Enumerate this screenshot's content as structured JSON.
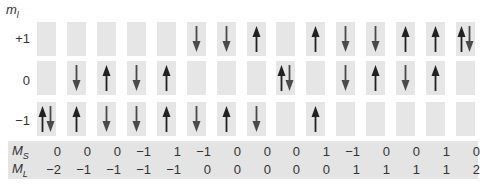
{
  "diagram": {
    "axis_title": "m",
    "axis_title_sub": "l",
    "row_labels": [
      "+1",
      "0",
      "−1"
    ],
    "ms_label": "M",
    "ms_label_sub": "S",
    "ml_label": "M",
    "ml_label_sub": "L",
    "colors": {
      "box": "#e6e6e6",
      "band": "#e4e4e4",
      "arrow_up": "#222222",
      "arrow_down": "#4a4a4a",
      "text": "#333333"
    },
    "columns": [
      {
        "plus1": "",
        "zero": "",
        "minus1": "updown",
        "MS": "0",
        "ML": "−2"
      },
      {
        "plus1": "",
        "zero": "down",
        "minus1": "up",
        "MS": "0",
        "ML": "−1"
      },
      {
        "plus1": "",
        "zero": "up",
        "minus1": "down",
        "MS": "0",
        "ML": "−1"
      },
      {
        "plus1": "",
        "zero": "down",
        "minus1": "down",
        "MS": "−1",
        "ML": "−1"
      },
      {
        "plus1": "",
        "zero": "up",
        "minus1": "up",
        "MS": "1",
        "ML": "−1"
      },
      {
        "plus1": "down",
        "zero": "",
        "minus1": "down",
        "MS": "−1",
        "ML": "0"
      },
      {
        "plus1": "down",
        "zero": "",
        "minus1": "up",
        "MS": "0",
        "ML": "0"
      },
      {
        "plus1": "up",
        "zero": "",
        "minus1": "down",
        "MS": "0",
        "ML": "0"
      },
      {
        "plus1": "",
        "zero": "updown",
        "minus1": "",
        "MS": "0",
        "ML": "0"
      },
      {
        "plus1": "up",
        "zero": "",
        "minus1": "up",
        "MS": "1",
        "ML": "0"
      },
      {
        "plus1": "down",
        "zero": "down",
        "minus1": "",
        "MS": "−1",
        "ML": "1"
      },
      {
        "plus1": "down",
        "zero": "up",
        "minus1": "",
        "MS": "0",
        "ML": "1"
      },
      {
        "plus1": "up",
        "zero": "down",
        "minus1": "",
        "MS": "0",
        "ML": "1"
      },
      {
        "plus1": "up",
        "zero": "up",
        "minus1": "",
        "MS": "1",
        "ML": "1"
      },
      {
        "plus1": "updown",
        "zero": "",
        "minus1": "",
        "MS": "0",
        "ML": "2"
      }
    ]
  }
}
